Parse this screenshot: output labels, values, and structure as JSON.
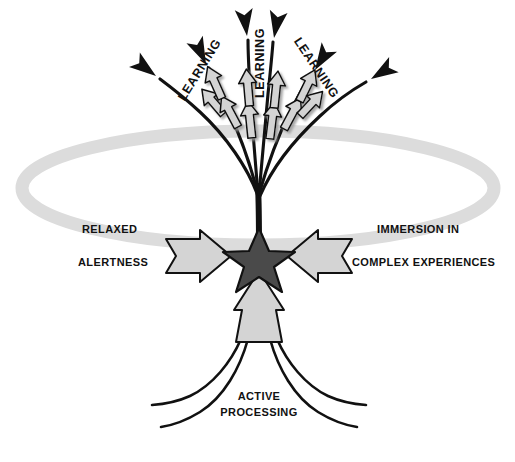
{
  "diagram": {
    "background_color": "#ffffff",
    "palette": {
      "ring": "#dcdcdc",
      "arrow_fill": "#d4d4d4",
      "arrow_stroke": "#111111",
      "star_fill": "#4a4a4a",
      "star_stroke": "#111111",
      "line": "#111111",
      "text": "#111111",
      "shadow": "#b4b4b4"
    },
    "center": {
      "shape": "star",
      "points": 5,
      "fill": "#4a4a4a",
      "cx": 259,
      "cy": 258
    },
    "ring": {
      "shape": "ellipse",
      "cx": 258,
      "cy": 188,
      "rx": 236,
      "ry": 57,
      "stroke_width": 13,
      "color": "#dcdcdc"
    },
    "labels": {
      "left": {
        "line1": "RELAXED",
        "line2": "ALERTNESS",
        "x": 82,
        "y1": 233,
        "y2": 266
      },
      "right": {
        "line1": "IMMERSION IN",
        "line2": "COMPLEX EXPERIENCES",
        "x": 377,
        "y1": 233,
        "y2": 266
      },
      "bottom": {
        "line1": "ACTIVE",
        "line2": "PROCESSING",
        "x": 259,
        "y1": 400,
        "y2": 416
      }
    },
    "learning_labels": [
      {
        "text": "LEARNING",
        "x": 203,
        "y": 72,
        "rotation": -58
      },
      {
        "text": "LEARNING",
        "x": 264,
        "y": 63,
        "rotation": -90
      },
      {
        "text": "LEARNING",
        "x": 313,
        "y": 70,
        "rotation": 56
      }
    ],
    "branches": [
      {
        "id": "branch-far-left",
        "arrowheads": 1,
        "chevrons": 1
      },
      {
        "id": "branch-left",
        "arrowheads": 1,
        "chevrons": 2
      },
      {
        "id": "branch-center-left",
        "arrowheads": 1,
        "chevrons": 2
      },
      {
        "id": "branch-center-right",
        "arrowheads": 1,
        "chevrons": 2
      },
      {
        "id": "branch-right",
        "arrowheads": 1,
        "chevrons": 2
      },
      {
        "id": "branch-far-right",
        "arrowheads": 1,
        "chevrons": 1
      }
    ],
    "side_arrows": [
      {
        "id": "arrow-relaxed-alertness",
        "direction": "right",
        "fill": "#d4d4d4"
      },
      {
        "id": "arrow-immersion",
        "direction": "left",
        "fill": "#d4d4d4"
      }
    ],
    "bottom_arrow": {
      "id": "arrow-active-processing",
      "direction": "up",
      "fill": "#d4d4d4",
      "tail_curves": 4
    }
  }
}
